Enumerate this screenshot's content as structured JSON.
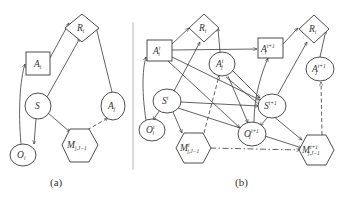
{
  "figure": {
    "divider_color": "#c8c8c8",
    "line_color": "#3a3a3a",
    "panel_a": {
      "caption": "(a)",
      "nodes": {
        "R_i": {
          "base": "R",
          "sub": "i",
          "sup": "",
          "shape": "diamond"
        },
        "A_i": {
          "base": "A",
          "sub": "i",
          "sup": "",
          "shape": "rectangle"
        },
        "A_j": {
          "base": "A",
          "sub": "j",
          "sup": "",
          "shape": "ellipse"
        },
        "S": {
          "base": "S",
          "sub": "",
          "sup": "",
          "shape": "ellipse"
        },
        "O_i": {
          "base": "O",
          "sub": "i",
          "sup": "",
          "shape": "ellipse"
        },
        "M": {
          "base": "M",
          "sub": "j,J−1",
          "sup": "",
          "shape": "hexagon"
        }
      },
      "edges": [
        {
          "from": "A_i",
          "to": "R_i",
          "style": "solid"
        },
        {
          "from": "S",
          "to": "R_i",
          "style": "solid"
        },
        {
          "from": "A_j",
          "to": "R_i",
          "style": "solid"
        },
        {
          "from": "O_i",
          "to": "A_i",
          "style": "solid"
        },
        {
          "from": "S",
          "to": "O_i",
          "style": "solid"
        },
        {
          "from": "S",
          "to": "M",
          "style": "solid"
        },
        {
          "from": "M",
          "to": "A_j",
          "style": "dashed"
        }
      ]
    },
    "panel_b": {
      "caption": "(b)",
      "nodes": {
        "R_i_t": {
          "base": "R",
          "sub": "i",
          "sup": "",
          "shape": "diamond"
        },
        "A_i_t": {
          "base": "A",
          "sub": "i",
          "sup": "t",
          "shape": "rectangle"
        },
        "A_j_t": {
          "base": "A",
          "sub": "j",
          "sup": "t",
          "shape": "ellipse"
        },
        "S_t": {
          "base": "S",
          "sub": "",
          "sup": "t",
          "shape": "ellipse"
        },
        "O_i_t": {
          "base": "O",
          "sub": "i",
          "sup": "t",
          "shape": "ellipse"
        },
        "M_t": {
          "base": "M",
          "sub": "j,J−1",
          "sup": "t",
          "shape": "hexagon"
        },
        "A_i_t1": {
          "base": "A",
          "sub": "i",
          "sup": "t+1",
          "shape": "rectangle"
        },
        "R_i_t1": {
          "base": "R",
          "sub": "i",
          "sup": "",
          "shape": "diamond"
        },
        "A_j_t1": {
          "base": "A",
          "sub": "j",
          "sup": "t+1",
          "shape": "ellipse"
        },
        "S_t1": {
          "base": "S",
          "sub": "",
          "sup": "t+1",
          "shape": "ellipse"
        },
        "O_i_t1": {
          "base": "O",
          "sub": "i",
          "sup": "t+1",
          "shape": "ellipse"
        },
        "M_t1": {
          "base": "M",
          "sub": "j,J−1",
          "sup": "t+1",
          "shape": "hexagon"
        }
      },
      "edges": [
        {
          "from": "A_i_t",
          "to": "R_i_t",
          "style": "solid"
        },
        {
          "from": "S_t",
          "to": "R_i_t",
          "style": "solid"
        },
        {
          "from": "A_j_t",
          "to": "R_i_t",
          "style": "solid"
        },
        {
          "from": "O_i_t",
          "to": "A_i_t",
          "style": "solid"
        },
        {
          "from": "S_t",
          "to": "O_i_t",
          "style": "solid"
        },
        {
          "from": "S_t",
          "to": "M_t",
          "style": "solid"
        },
        {
          "from": "M_t",
          "to": "A_j_t",
          "style": "dashed"
        },
        {
          "from": "A_i_t",
          "to": "A_i_t1",
          "style": "solid"
        },
        {
          "from": "A_i_t",
          "to": "S_t1",
          "style": "solid"
        },
        {
          "from": "A_i_t",
          "to": "O_i_t1",
          "style": "solid"
        },
        {
          "from": "A_j_t",
          "to": "S_t1",
          "style": "solid"
        },
        {
          "from": "A_j_t",
          "to": "O_i_t1",
          "style": "solid"
        },
        {
          "from": "A_j_t",
          "to": "M_t1",
          "style": "solid"
        },
        {
          "from": "S_t",
          "to": "S_t1",
          "style": "solid"
        },
        {
          "from": "S_t",
          "to": "M_t1",
          "style": "solid"
        },
        {
          "from": "M_t",
          "to": "M_t1",
          "style": "dashdot"
        },
        {
          "from": "A_i_t1",
          "to": "R_i_t1",
          "style": "solid"
        },
        {
          "from": "S_t1",
          "to": "R_i_t1",
          "style": "solid"
        },
        {
          "from": "A_j_t1",
          "to": "R_i_t1",
          "style": "solid"
        },
        {
          "from": "O_i_t1",
          "to": "A_i_t1",
          "style": "solid"
        },
        {
          "from": "S_t1",
          "to": "O_i_t1",
          "style": "solid"
        },
        {
          "from": "S_t1",
          "to": "M_t1",
          "style": "solid"
        },
        {
          "from": "M_t1",
          "to": "A_j_t1",
          "style": "dashed"
        }
      ]
    }
  }
}
